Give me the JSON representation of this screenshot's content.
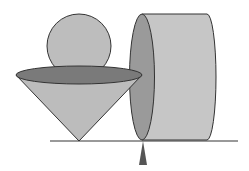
{
  "diagram": {
    "title": "",
    "colors": {
      "stroke": "#333333",
      "sphere": "#bdbdbd",
      "cone_body": "#bcbcbc",
      "cone_top": "#7a7a7a",
      "cylinder_body": "#c6c6c6",
      "cylinder_face": "#9a9a9a",
      "ground": "#777777",
      "pointer": "#555555"
    },
    "shapes": [
      "sphere",
      "cone",
      "cylinder",
      "ground-line",
      "pointer-triangle"
    ]
  }
}
